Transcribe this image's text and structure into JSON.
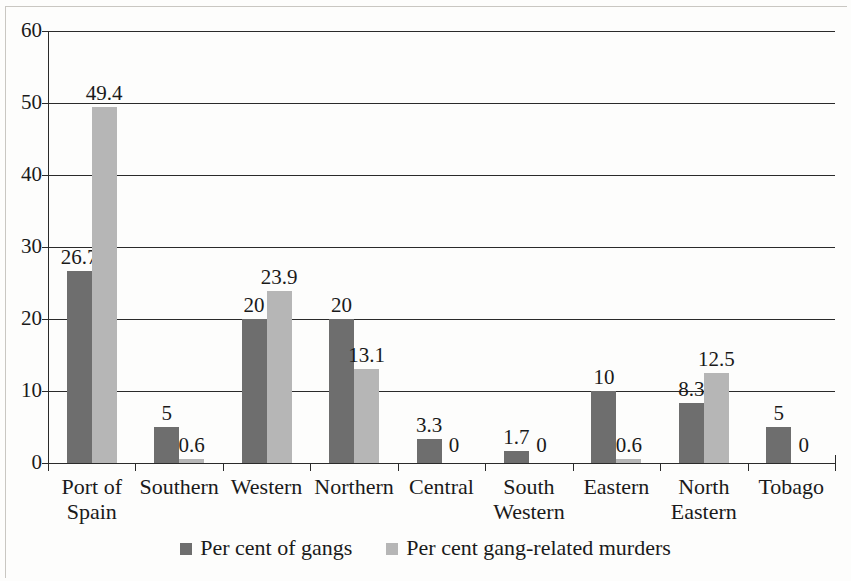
{
  "chart_data": {
    "type": "bar",
    "title": "",
    "subtitle": "",
    "xlabel": "",
    "ylabel": "",
    "ylim": [
      0,
      60
    ],
    "ytick_step": 10,
    "yticks": [
      "60",
      "50",
      "40",
      "30",
      "20",
      "10",
      "0"
    ],
    "grid": "horizontal",
    "legend_position": "bottom-center",
    "categories": [
      "Port of\nSpain",
      "Southern",
      "Western",
      "Northern",
      "Central",
      "South\nWestern",
      "Eastern",
      "North\nEastern",
      "Tobago"
    ],
    "series": [
      {
        "name": "Per cent of gangs",
        "color": "#6e6e6e",
        "values": [
          26.7,
          5,
          20,
          20,
          3.3,
          1.7,
          10,
          8.3,
          5
        ],
        "labels": [
          "26.7",
          "5",
          "20",
          "20",
          "3.3",
          "1.7",
          "10",
          "8.3",
          "5"
        ]
      },
      {
        "name": "Per cent gang-related murders",
        "color": "#b6b6b6",
        "values": [
          49.4,
          0.6,
          23.9,
          13.1,
          0,
          0,
          0.6,
          12.5,
          0
        ],
        "labels": [
          "49.4",
          "0.6",
          "23.9",
          "13.1",
          "0",
          "0",
          "0.6",
          "12.5",
          "0"
        ]
      }
    ]
  },
  "legend": {
    "items": [
      {
        "label": "Per cent of gangs",
        "color": "#6e6e6e"
      },
      {
        "label": "Per cent gang-related murders",
        "color": "#b6b6b6"
      }
    ]
  }
}
